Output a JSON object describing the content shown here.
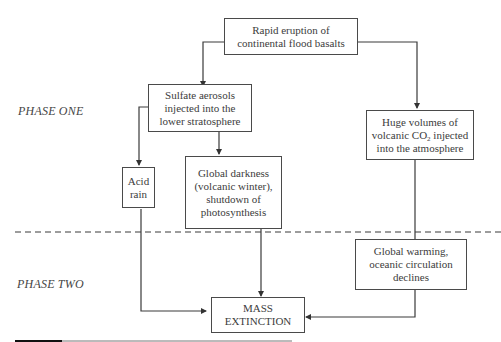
{
  "phases": {
    "one": "PHASE ONE",
    "two": "PHASE TWO"
  },
  "nodes": {
    "eruption": {
      "line1": "Rapid eruption of",
      "line2": "continental flood basalts"
    },
    "sulfate": {
      "line1": "Sulfate aerosols",
      "line2": "injected into the",
      "line3": "lower stratosphere"
    },
    "co2": {
      "line1": "Huge volumes of",
      "line2_pre": "volcanic CO",
      "line2_sub": "2",
      "line2_post": " injected",
      "line3": "into the atmosphere"
    },
    "acid_rain": {
      "line1": "Acid",
      "line2": "rain"
    },
    "darkness": {
      "line1": "Global darkness",
      "line2": "(volcanic winter),",
      "line3": "shutdown of",
      "line4": "photosynthesis"
    },
    "warming": {
      "line1": "Global warming,",
      "line2": "oceanic circulation",
      "line3": "declines"
    },
    "extinction": {
      "line1": "MASS",
      "line2": "EXTINCTION"
    }
  },
  "edges": [
    {
      "from": "eruption",
      "to": "sulfate"
    },
    {
      "from": "eruption",
      "to": "co2"
    },
    {
      "from": "sulfate",
      "to": "acid_rain"
    },
    {
      "from": "sulfate",
      "to": "darkness"
    },
    {
      "from": "co2",
      "to": "warming"
    },
    {
      "from": "acid_rain",
      "to": "extinction"
    },
    {
      "from": "darkness",
      "to": "extinction"
    },
    {
      "from": "warming",
      "to": "extinction"
    }
  ],
  "colors": {
    "line": "#3a3a3a",
    "text": "#3c3c3c",
    "background": "#ffffff"
  }
}
